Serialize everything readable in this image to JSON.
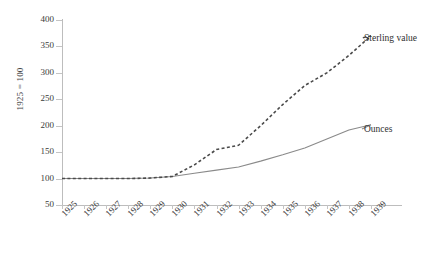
{
  "chart_data": {
    "type": "line",
    "title": "",
    "xlabel": "",
    "ylabel": "1925 = 100",
    "x": [
      1925,
      1926,
      1927,
      1928,
      1929,
      1930,
      1931,
      1932,
      1933,
      1934,
      1935,
      1936,
      1937,
      1938,
      1939
    ],
    "xtick_labels": [
      "1925",
      "1926",
      "1927",
      "1928",
      "1929",
      "1930",
      "1931",
      "1932",
      "1933",
      "1934",
      "1935",
      "1936",
      "1937",
      "1938",
      "1939"
    ],
    "ytick_labels": [
      "50",
      "100",
      "150",
      "200",
      "250",
      "300",
      "350",
      "400"
    ],
    "ytick_values": [
      50,
      100,
      150,
      200,
      250,
      300,
      350,
      400
    ],
    "ylim": [
      50,
      400
    ],
    "xlim": [
      1925,
      1939
    ],
    "grid": false,
    "legend_position": "right-inline",
    "series": [
      {
        "name": "Sterling value",
        "style": "dashed",
        "color": "#4a4a4a",
        "values": [
          100,
          100,
          100,
          100,
          101,
          104,
          126,
          155,
          163,
          200,
          240,
          276,
          300,
          333,
          370
        ]
      },
      {
        "name": "Ounces",
        "style": "solid",
        "color": "#8a8a8a",
        "values": [
          100,
          100,
          100,
          100,
          101,
          104,
          110,
          116,
          122,
          133,
          145,
          158,
          175,
          192,
          202
        ]
      }
    ],
    "annotations": [
      {
        "text": "Sterling value",
        "x": 1939,
        "y": 370
      },
      {
        "text": "Ounces",
        "x": 1939,
        "y": 202
      }
    ]
  },
  "labels": {
    "y_axis_title": "1925 = 100",
    "sterling": "Sterling value",
    "ounces": "Ounces"
  }
}
